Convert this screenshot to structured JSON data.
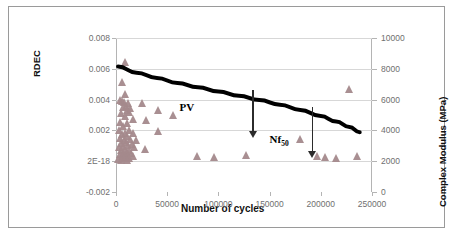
{
  "chart_data": {
    "type": "scatter",
    "title": "",
    "xlabel": "Number of cycles",
    "ylabel": "RDEC",
    "y2label": "Complex Modulus (MPa)",
    "xlim": [
      0,
      250000
    ],
    "ylim": [
      -0.002,
      0.008
    ],
    "y2lim": [
      0,
      10000
    ],
    "grid": true,
    "legend": "none",
    "x_ticks": [
      "0",
      "50000",
      "100000",
      "150000",
      "200000",
      "250000"
    ],
    "x_tick_values": [
      0,
      50000,
      100000,
      150000,
      200000,
      250000
    ],
    "y_ticks": [
      "-0.002",
      "2E-18",
      "0.002",
      "0.004",
      "0.006",
      "0.008"
    ],
    "y_tick_values": [
      -0.002,
      0,
      0.002,
      0.004,
      0.006,
      0.008
    ],
    "y2_ticks": [
      "0",
      "2000",
      "4000",
      "6000",
      "8000",
      "10000"
    ],
    "y2_tick_values": [
      0,
      2000,
      4000,
      6000,
      8000,
      10000
    ],
    "series": [
      {
        "name": "Complex Modulus (MPa)",
        "type": "scatter",
        "marker": "triangle",
        "color": "#a4898c",
        "axis": "y2",
        "points": [
          [
            9000,
            8450
          ],
          [
            6500,
            7150
          ],
          [
            9500,
            6350
          ],
          [
            4000,
            5950
          ],
          [
            6000,
            5900
          ],
          [
            8000,
            5850
          ],
          [
            12500,
            5800
          ],
          [
            10500,
            5600
          ],
          [
            7000,
            5500
          ],
          [
            14500,
            5450
          ],
          [
            11000,
            5350
          ],
          [
            26000,
            5750
          ],
          [
            13000,
            5200
          ],
          [
            5000,
            5150
          ],
          [
            42000,
            5300
          ],
          [
            9000,
            4950
          ],
          [
            56000,
            5000
          ],
          [
            17000,
            4750
          ],
          [
            30000,
            4700
          ],
          [
            4500,
            4550
          ],
          [
            11500,
            4500
          ],
          [
            7500,
            4250
          ],
          [
            3500,
            4050
          ],
          [
            13500,
            4000
          ],
          [
            42000,
            3950
          ],
          [
            9000,
            3850
          ],
          [
            6000,
            3750
          ],
          [
            17500,
            3800
          ],
          [
            11000,
            3600
          ],
          [
            4000,
            3500
          ],
          [
            14000,
            3450
          ],
          [
            8000,
            3400
          ],
          [
            20000,
            3350
          ],
          [
            10000,
            3250
          ],
          [
            5500,
            3150
          ],
          [
            16000,
            3100
          ],
          [
            12000,
            3050
          ],
          [
            7000,
            2950
          ],
          [
            3500,
            2900
          ],
          [
            18500,
            2900
          ],
          [
            9500,
            2800
          ],
          [
            13000,
            2750
          ],
          [
            5000,
            2700
          ],
          [
            29000,
            2800
          ],
          [
            11000,
            2600
          ],
          [
            7500,
            2550
          ],
          [
            15500,
            2500
          ],
          [
            4000,
            2450
          ],
          [
            9000,
            2400
          ],
          [
            12500,
            2350
          ],
          [
            6000,
            2300
          ],
          [
            17000,
            2300
          ],
          [
            10500,
            2250
          ],
          [
            8000,
            2200
          ],
          [
            13500,
            2200
          ],
          [
            3000,
            2150
          ],
          [
            11000,
            2100
          ],
          [
            5500,
            2100
          ],
          [
            80000,
            2300
          ],
          [
            96000,
            2250
          ],
          [
            128000,
            2400
          ],
          [
            197000,
            2300
          ],
          [
            205000,
            2250
          ],
          [
            215000,
            2200
          ],
          [
            180000,
            3450
          ],
          [
            228000,
            6700
          ],
          [
            236000,
            2350
          ]
        ]
      },
      {
        "name": "RDEC trend",
        "type": "line",
        "color": "#000000",
        "axis": "y",
        "linewidth": 4,
        "points": [
          [
            2000,
            0.00615
          ],
          [
            20000,
            0.00575
          ],
          [
            40000,
            0.0054
          ],
          [
            60000,
            0.00508
          ],
          [
            80000,
            0.0048
          ],
          [
            100000,
            0.00452
          ],
          [
            120000,
            0.00425
          ],
          [
            140000,
            0.00397
          ],
          [
            160000,
            0.00367
          ],
          [
            180000,
            0.00333
          ],
          [
            200000,
            0.00293
          ],
          [
            215000,
            0.00258
          ],
          [
            228000,
            0.00222
          ],
          [
            238000,
            0.00188
          ]
        ]
      }
    ],
    "annotations": [
      {
        "name": "pv-label",
        "text": "PV",
        "x": 62000,
        "y": 0.00345
      },
      {
        "name": "nf50-label",
        "text": "Nf",
        "sub": "50",
        "x": 150000,
        "y": 0.00137
      },
      {
        "name": "pv-arrow",
        "x": 133000,
        "y_from": 0.0046,
        "y_to": 0.00155
      },
      {
        "name": "nf50-arrow",
        "x": 191000,
        "y_from": 0.0035,
        "y_to": 0.0003
      }
    ]
  },
  "axes": {
    "x_title": "Number of cycles",
    "y_left_title": "RDEC",
    "y_right_title": "Complex Modulus (MPa)"
  },
  "colors": {
    "marker": "#a4898c",
    "trendline": "#000000",
    "gridline": "#d7d7d7",
    "axis": "#b4b4b4",
    "tick_text": "#6f6f6f",
    "frame": "#9a9a9a",
    "background": "#ffffff",
    "annotation": "#000000",
    "arrow": "#2b2b2b"
  }
}
